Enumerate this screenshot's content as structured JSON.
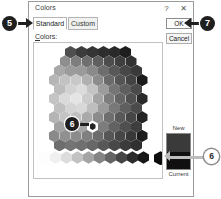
{
  "dialog": {
    "title": "Colors",
    "help_icon": "question-mark-icon",
    "close_icon": "close-icon"
  },
  "tabs": [
    {
      "label": "Standard",
      "active": true
    },
    {
      "label": "Custom",
      "active": false
    }
  ],
  "fields": {
    "colors_label_accel": "C",
    "colors_label_rest": "olors:"
  },
  "buttons": {
    "ok": "OK",
    "cancel": "Cancel"
  },
  "preview": {
    "new_label": "New",
    "current_label": "Current",
    "new_color": "#3a3a3a",
    "current_color": "#101010"
  },
  "callouts": [
    {
      "id": "5",
      "label": "5",
      "target": "standard-tab",
      "style": "dark"
    },
    {
      "id": "7",
      "label": "7",
      "target": "ok-button",
      "style": "dark"
    },
    {
      "id": "6a",
      "label": "6",
      "target": "hex-selected-swatch",
      "style": "dark"
    },
    {
      "id": "6b",
      "label": "6",
      "target": "new-current-preview",
      "style": "light"
    }
  ],
  "palette": {
    "note": "standard-colors-hexagon",
    "hex_rows": [
      [
        "#4f4f4f",
        "#3c3c3c",
        "#353535",
        "#2e2e2e",
        "#2a2a2a",
        "#1e1e1e"
      ],
      [
        "#8e8e8e",
        "#7d7d7d",
        "#6f6f6f",
        "#5f5f5f",
        "#4d4d4d",
        "#3f3f3f",
        "#333333"
      ],
      [
        "#a8a8a8",
        "#9c9c9c",
        "#9a9a9a",
        "#8a8a8a",
        "#6e6e6e",
        "#585858",
        "#474747",
        "#3a3a3a"
      ],
      [
        "#b6b6b6",
        "#c2c2c2",
        "#c8c8c8",
        "#b0b0b0",
        "#8c8c8c",
        "#6a6a6a",
        "#555555",
        "#444444",
        "#1b1b1b"
      ],
      [
        "#bcbcbc",
        "#d2d2d2",
        "#dcdcdc",
        "#c4c4c4",
        "#9c9c9c",
        "#757575",
        "#5e5e5e",
        "#4a4a4a"
      ],
      [
        "#c4c4c4",
        "#dadada",
        "#e4e4e4",
        "#cccccc",
        "#a4a4a4",
        "#7d7d7d",
        "#646464",
        "#505050",
        "#2a2a2a"
      ],
      [
        "#c0c0c0",
        "#d4d4d4",
        "#d8d8d8",
        "#bebebe",
        "#9a9a9a",
        "#787878",
        "#5f5f5f",
        "#4b4b4b"
      ],
      [
        "#b4b4b4",
        "#c4c4c4",
        "#c0c0c0",
        "#aaaaaa",
        "#8c8c8c",
        "#6e6e6e",
        "#585858",
        "#464646",
        "#242424"
      ],
      [
        "#a2a2a2",
        "#aaaaaa",
        "#a4a4a4",
        "#949494",
        "#7c7c7c",
        "#626262",
        "#4f4f4f",
        "#3e3e3e"
      ],
      [
        "#8a8a8a",
        "#909090",
        "#8c8c8c",
        "#808080",
        "#6c6c6c",
        "#565656",
        "#464646",
        "#383838",
        "#1c1c1c"
      ],
      [
        "#6e6e6e",
        "#747474",
        "#707070",
        "#676767",
        "#585858",
        "#484848",
        "#3b3b3b",
        "#303030"
      ]
    ],
    "gray_ramp": [
      "#fdfdfd",
      "#f0f0f0",
      "#dcdcdc",
      "#c2c2c2",
      "#a4a4a4",
      "#848484",
      "#646464",
      "#464646",
      "#2c2c2c",
      "#171717"
    ],
    "black_swatch": "#0d0d0d"
  }
}
